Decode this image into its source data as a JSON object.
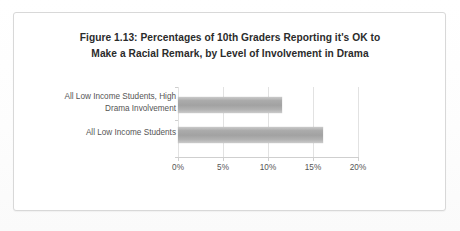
{
  "document": {
    "kind": "scanned-figure-page"
  },
  "figure": {
    "title_line_1": "Figure 1.13:  Percentages of 10th Graders Reporting it's OK to",
    "title_line_2": "Make a Racial Remark, by Level of Involvement in Drama"
  },
  "chart_data": {
    "type": "bar",
    "orientation": "horizontal",
    "title": "Figure 1.13:  Percentages of 10th Graders Reporting it's OK to Make a Racial Remark, by Level of Involvement in Drama",
    "categories": [
      "All Low Income Students, High Drama Involvement",
      "All Low Income Students"
    ],
    "category_lines": [
      [
        "All Low Income Students, High",
        "Drama Involvement"
      ],
      [
        "All Low Income Students"
      ]
    ],
    "values": [
      11.5,
      16
    ],
    "value_labels": [
      "11.5%",
      "16%"
    ],
    "xlabel": "",
    "ylabel": "",
    "xlim": [
      0,
      20
    ],
    "tick_values": [
      0,
      5,
      10,
      15,
      20
    ],
    "tick_labels": [
      "0%",
      "5%",
      "10%",
      "15%",
      "20%"
    ],
    "grid": true,
    "grid_axis": "x",
    "legend": false,
    "bar_color": "#a8a8a8",
    "grid_color": "#e2e2e2",
    "axis_color": "#cfcfcf",
    "text_color": "#555555"
  }
}
